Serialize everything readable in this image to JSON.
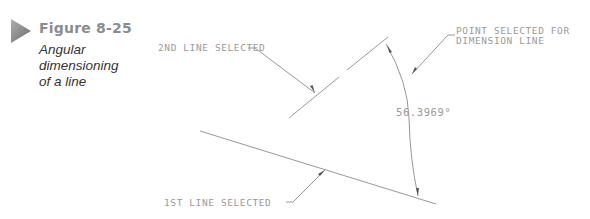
{
  "figure": {
    "number": "Figure 8-25",
    "caption_lines": [
      "Angular",
      "dimensioning",
      "of a line"
    ],
    "icon": "play-triangle-icon",
    "accent_color": "#8a8d90"
  },
  "drawing": {
    "labels": {
      "second_line": "2ND LINE SELECTED",
      "first_line": "1ST LINE SELECTED",
      "point_selected_line1": "POINT SELECTED FOR",
      "point_selected_line2": "DIMENSION LINE",
      "angle_value": "56.3969°"
    },
    "line_color": "#8c8c8c",
    "text_color": "#9a9a9a"
  }
}
